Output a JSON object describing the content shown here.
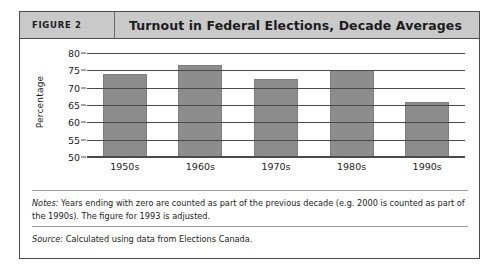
{
  "figure": {
    "label": "FIGURE 2",
    "title": "Turnout in Federal Elections, Decade Averages",
    "notes_lead": "Notes:",
    "notes_text": " Years ending with zero are counted as part of the previous decade (e.g. 2000 is counted as part of the 1990s). The figure for 1993 is adjusted.",
    "source_lead": "Source:",
    "source_text": " Calculated using data from Elections Canada.",
    "colors": {
      "bar_fill": "#8c8c8c",
      "header_band": "#c9c9c9",
      "border": "#4d4d4d",
      "gridline": "#4a4a4a",
      "page_background": "#ffffff"
    }
  },
  "chart_data": {
    "type": "bar",
    "title": "Turnout in Federal Elections, Decade Averages",
    "xlabel": "",
    "ylabel": "Percentage",
    "categories": [
      "1950s",
      "1960s",
      "1970s",
      "1980s",
      "1990s"
    ],
    "values": [
      74.0,
      76.5,
      72.5,
      75.0,
      66.0
    ],
    "ylim": [
      50,
      80
    ],
    "yticks": [
      50,
      55,
      60,
      65,
      70,
      75,
      80
    ],
    "ytick_labels": [
      "50",
      "55",
      "60",
      "65",
      "70",
      "75",
      "80"
    ],
    "grid": true,
    "legend": "none",
    "series": [
      {
        "name": "Turnout",
        "values": [
          74.0,
          76.5,
          72.5,
          75.0,
          66.0
        ]
      }
    ]
  }
}
